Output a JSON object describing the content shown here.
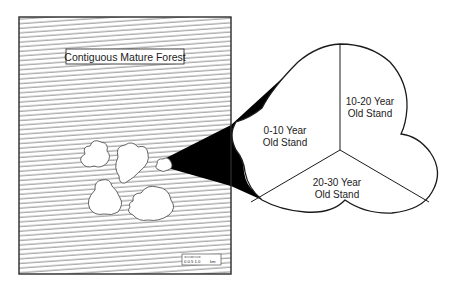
{
  "diagram": {
    "forest_panel": {
      "label": "Contiguous Mature Forest",
      "scale_bar": {
        "ticks": "0  0.5 1.0",
        "unit": "km"
      }
    },
    "zoom_stand": {
      "sections": [
        {
          "line1": "0-10 Year",
          "line2": "Old Stand"
        },
        {
          "line1": "10-20 Year",
          "line2": "Old Stand"
        },
        {
          "line1": "20-30 Year",
          "line2": "Old Stand"
        }
      ]
    },
    "colors": {
      "outline": "#1a1a1a",
      "hatch": "#7a7a7a",
      "connector": "#000000",
      "background": "#ffffff"
    }
  }
}
